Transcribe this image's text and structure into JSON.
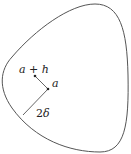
{
  "diagram": {
    "labels": {
      "point_a_plus_h": "a + h",
      "point_a": "a",
      "radius_num": "2",
      "radius_sym": "δ"
    },
    "colors": {
      "stroke": "#555555",
      "text": "#222222"
    }
  }
}
